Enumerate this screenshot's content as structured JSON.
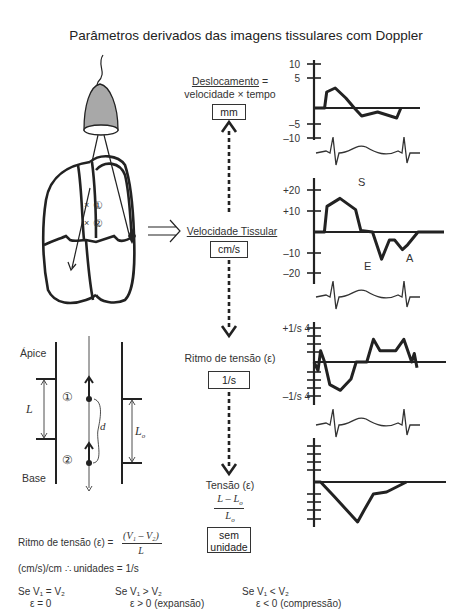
{
  "title": "Parâmetros derivados das imagens tissulares com Doppler",
  "center_flow": {
    "displacement": {
      "label": "Deslocamento",
      "formula_rhs": "velocidade × tempo",
      "eq": "=",
      "unit": "mm"
    },
    "velocity": {
      "label": "Velocidade Tissular",
      "unit": "cm/s"
    },
    "strain_rate": {
      "label": "Ritmo de tensão (ε)",
      "unit": "1/s"
    },
    "strain": {
      "label": "Tensão (ε)",
      "numerator": "L – L",
      "numerator_sub": "o",
      "denominator": "L",
      "denominator_sub": "o",
      "unit_line1": "sem",
      "unit_line2": "unidade"
    }
  },
  "heart_diagram": {
    "marker1": "①",
    "marker2": "②"
  },
  "segment_diagram": {
    "apex_label": "Ápice",
    "base_label": "Base",
    "L_label": "L",
    "L0_label": "L",
    "L0_sub": "o",
    "d_label": "d",
    "marker1": "①",
    "marker2": "②"
  },
  "bottom_text": {
    "formula_prefix": "Ritmo de tensão (ε) =",
    "formula_num": "(V₁ – V₂)",
    "formula_den": "L",
    "units_line": "(cm/s)/cm ∴ unidades = 1/s",
    "cases": [
      {
        "cond": "Se V₁ = V₂",
        "result": "ε = 0"
      },
      {
        "cond": "Se V₁ > V₂",
        "result": "ε > 0 (expansão)"
      },
      {
        "cond": "Se V₁ < V₂",
        "result": "ε < 0 (compressão)"
      }
    ]
  },
  "chart_data": [
    {
      "type": "line",
      "title": "Deslocamento",
      "unit": "mm",
      "yticks": [
        "10",
        "5",
        "–5",
        "–10"
      ],
      "ylim": [
        -15,
        15
      ],
      "x": [
        0,
        0.1,
        0.12,
        0.2,
        0.3,
        0.38,
        0.45,
        0.6,
        0.78,
        0.82
      ],
      "values": [
        0,
        0,
        8,
        10,
        5,
        0,
        -4,
        -2,
        -5,
        0
      ]
    },
    {
      "type": "line",
      "title": "Velocidade Tissular",
      "unit": "cm/s",
      "yticks": [
        "+20",
        "+10",
        "–10",
        "–20"
      ],
      "ylim": [
        -25,
        25
      ],
      "annotations": [
        "S",
        "E",
        "A"
      ],
      "x": [
        0,
        0.08,
        0.1,
        0.2,
        0.32,
        0.36,
        0.45,
        0.52,
        0.58,
        0.62,
        0.68,
        0.72,
        0.8,
        1.0
      ],
      "values": [
        0,
        0,
        16,
        21,
        14,
        1,
        0,
        -17,
        -5,
        -5,
        -11,
        -8,
        0,
        0
      ]
    },
    {
      "type": "line",
      "title": "Ritmo de tensão",
      "unit": "1/s",
      "yticks": [
        "+1/s 4",
        "–1/s 4"
      ],
      "ylim": [
        -1.2,
        1.2
      ],
      "x": [
        0,
        0.03,
        0.05,
        0.08,
        0.12,
        0.2,
        0.28,
        0.32,
        0.4,
        0.45,
        0.5,
        0.62,
        0.68,
        0.74,
        0.76,
        0.78
      ],
      "values": [
        0,
        -0.3,
        0.4,
        0,
        -0.8,
        -1.0,
        -0.6,
        0,
        0,
        0.8,
        0.4,
        0.4,
        0.8,
        0,
        0.3,
        -0.2
      ]
    },
    {
      "type": "line",
      "title": "Tensão",
      "unit": "sem unidade",
      "ylim": [
        -1,
        1
      ],
      "x": [
        0,
        0.05,
        0.15,
        0.33,
        0.38,
        0.45,
        0.55,
        0.7
      ],
      "values": [
        0,
        0,
        -0.35,
        -1.0,
        -0.7,
        -0.3,
        -0.25,
        0
      ]
    }
  ]
}
